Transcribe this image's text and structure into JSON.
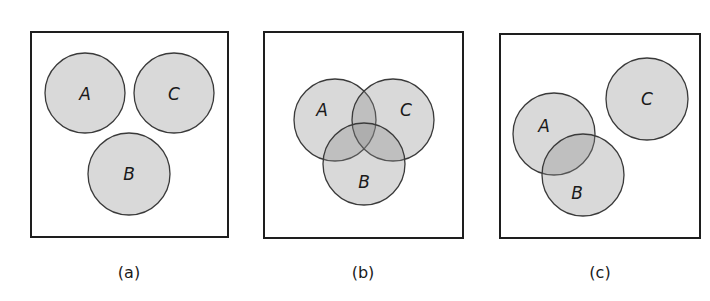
{
  "diagram": {
    "type": "venn-diagram-set",
    "panels": [
      {
        "id": "a",
        "caption": "(a)",
        "description": "Three mutually disjoint sets",
        "box": {
          "x": 31,
          "y": 32,
          "w": 197,
          "h": 205
        },
        "caption_pos": {
          "x": 129,
          "y": 272
        },
        "sets": [
          {
            "label": "A",
            "cx": 85,
            "cy": 93,
            "r": 40
          },
          {
            "label": "C",
            "cx": 174,
            "cy": 93,
            "r": 40
          },
          {
            "label": "B",
            "cx": 129,
            "cy": 174,
            "r": 41
          }
        ]
      },
      {
        "id": "b",
        "caption": "(b)",
        "description": "Three mutually overlapping sets",
        "box": {
          "x": 264,
          "y": 32,
          "w": 199,
          "h": 206
        },
        "caption_pos": {
          "x": 363,
          "y": 272
        },
        "sets": [
          {
            "label": "A",
            "cx": 335,
            "cy": 120,
            "r": 41
          },
          {
            "label": "C",
            "cx": 393,
            "cy": 120,
            "r": 41
          },
          {
            "label": "B",
            "cx": 364,
            "cy": 164,
            "r": 41
          }
        ]
      },
      {
        "id": "c",
        "caption": "(c)",
        "description": "A and B overlap; C disjoint",
        "box": {
          "x": 500,
          "y": 34,
          "w": 200,
          "h": 204
        },
        "caption_pos": {
          "x": 600,
          "y": 272
        },
        "sets": [
          {
            "label": "A",
            "cx": 554,
            "cy": 134,
            "r": 41
          },
          {
            "label": "B",
            "cx": 583,
            "cy": 175,
            "r": 41
          },
          {
            "label": "C",
            "cx": 647,
            "cy": 99,
            "r": 41
          }
        ]
      }
    ],
    "label_offsets": {
      "a": {
        "A": [
          0,
          1
        ],
        "C": [
          0,
          1
        ],
        "B": [
          0,
          0
        ]
      },
      "b": {
        "A": [
          -13,
          -10
        ],
        "C": [
          13,
          -10
        ],
        "B": [
          0,
          18
        ]
      },
      "c": {
        "A": [
          -10,
          -8
        ],
        "B": [
          -6,
          18
        ],
        "C": [
          0,
          0
        ]
      }
    },
    "colors": {
      "circle_fill": "rgba(140,140,140,0.33)",
      "circle_stroke": "#3a3a3a",
      "box_stroke": "#1e1e1e",
      "text": "#1a1a1a"
    }
  }
}
